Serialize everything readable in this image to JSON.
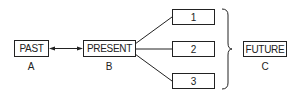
{
  "diagram": {
    "nodes": {
      "past": {
        "label": "PAST",
        "caption": "A"
      },
      "present": {
        "label": "PRESENT",
        "caption": "B"
      },
      "option1": {
        "label": "1"
      },
      "option2": {
        "label": "2"
      },
      "option3": {
        "label": "3"
      },
      "future": {
        "label": "FUTURE",
        "caption": "C"
      }
    },
    "edges": [
      {
        "from": "past",
        "to": "present",
        "type": "bidirectional-arrow"
      },
      {
        "from": "present",
        "to": "option1",
        "type": "line"
      },
      {
        "from": "present",
        "to": "option2",
        "type": "line"
      },
      {
        "from": "present",
        "to": "option3",
        "type": "line"
      },
      {
        "from": "option1-3",
        "to": "future",
        "type": "brace-group"
      }
    ],
    "stroke_color": "#222222"
  }
}
